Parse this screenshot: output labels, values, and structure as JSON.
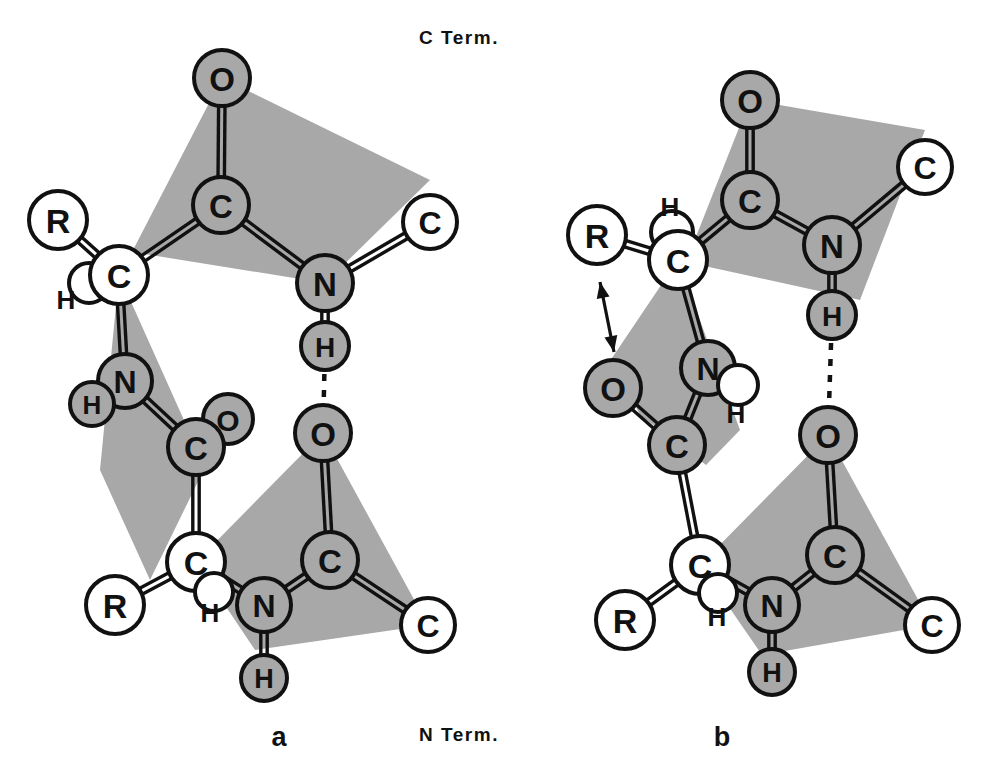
{
  "figure": {
    "title_top": "C Term.",
    "title_bottom": "N Term.",
    "panel_a_label": "a",
    "panel_b_label": "b",
    "colors": {
      "background": "#ffffff",
      "plane_fill": "#a8a8a8",
      "atom_filled": "#a8a8a8",
      "atom_open": "#ffffff",
      "stroke": "#111111"
    }
  },
  "chart_data": {
    "type": "diagram",
    "panels": [
      {
        "id": "a",
        "label": "a",
        "planes": [
          {
            "name": "amide-plane-a-top",
            "points": "222,78 430,180 325,283 132,252"
          },
          {
            "name": "amide-plane-a-middle",
            "points": "119,275 196,447 228,420 150,580 100,470"
          },
          {
            "name": "amide-plane-a-bottom",
            "points": "323,433 428,625 255,650 196,562"
          }
        ],
        "atoms": [
          {
            "id": "a-O1",
            "label": "O",
            "x": 222,
            "y": 78,
            "r": 28,
            "fill": "filled"
          },
          {
            "id": "a-C1",
            "label": "C",
            "x": 221,
            "y": 205,
            "r": 28,
            "fill": "filled"
          },
          {
            "id": "a-N1",
            "label": "N",
            "x": 325,
            "y": 283,
            "r": 28,
            "fill": "filled"
          },
          {
            "id": "a-Cterm1",
            "label": "C",
            "x": 430,
            "y": 222,
            "r": 27,
            "fill": "open"
          },
          {
            "id": "a-H1",
            "label": "H",
            "x": 325,
            "y": 346,
            "r": 24,
            "fill": "filled"
          },
          {
            "id": "a-R1",
            "label": "R",
            "x": 58,
            "y": 220,
            "r": 29,
            "fill": "open"
          },
          {
            "id": "a-Hsmall1",
            "label": "",
            "x": 89,
            "y": 283,
            "r": 20,
            "fill": "open"
          },
          {
            "id": "a-CA1",
            "label": "C",
            "x": 119,
            "y": 275,
            "r": 29,
            "fill": "open"
          },
          {
            "id": "a-N2",
            "label": "N",
            "x": 125,
            "y": 381,
            "r": 27,
            "fill": "filled"
          },
          {
            "id": "a-H2",
            "label": "H",
            "x": 92,
            "y": 404,
            "r": 22,
            "fill": "filled"
          },
          {
            "id": "a-Osm",
            "label": "O",
            "x": 228,
            "y": 419,
            "r": 25,
            "fill": "filled"
          },
          {
            "id": "a-C2",
            "label": "C",
            "x": 196,
            "y": 447,
            "r": 28,
            "fill": "filled"
          },
          {
            "id": "a-CA2",
            "label": "C",
            "x": 196,
            "y": 562,
            "r": 29,
            "fill": "open"
          },
          {
            "id": "a-Hsmall2",
            "label": "",
            "x": 214,
            "y": 592,
            "r": 19,
            "fill": "open"
          },
          {
            "id": "a-R2",
            "label": "R",
            "x": 115,
            "y": 605,
            "r": 29,
            "fill": "open"
          },
          {
            "id": "a-O2",
            "label": "O",
            "x": 323,
            "y": 433,
            "r": 28,
            "fill": "filled"
          },
          {
            "id": "a-C3",
            "label": "C",
            "x": 330,
            "y": 560,
            "r": 28,
            "fill": "filled"
          },
          {
            "id": "a-N3",
            "label": "N",
            "x": 264,
            "y": 605,
            "r": 27,
            "fill": "filled"
          },
          {
            "id": "a-H3",
            "label": "H",
            "x": 264,
            "y": 678,
            "r": 23,
            "fill": "filled"
          },
          {
            "id": "a-Cterm2",
            "label": "C",
            "x": 428,
            "y": 625,
            "r": 27,
            "fill": "open"
          }
        ],
        "text_labels": [
          {
            "text": "H",
            "x": 66,
            "y": 300
          },
          {
            "text": "H",
            "x": 210,
            "y": 613
          }
        ],
        "bonds": [
          {
            "from": "a-O1",
            "to": "a-C1",
            "order": "double"
          },
          {
            "from": "a-C1",
            "to": "a-N1",
            "order": "double"
          },
          {
            "from": "a-N1",
            "to": "a-Cterm1",
            "order": "double"
          },
          {
            "from": "a-N1",
            "to": "a-H1",
            "order": "double"
          },
          {
            "from": "a-C1",
            "to": "a-CA1",
            "order": "double"
          },
          {
            "from": "a-CA1",
            "to": "a-R1",
            "order": "double"
          },
          {
            "from": "a-CA1",
            "to": "a-N2",
            "order": "double"
          },
          {
            "from": "a-N2",
            "to": "a-C2",
            "order": "double"
          },
          {
            "from": "a-C2",
            "to": "a-CA2",
            "order": "double"
          },
          {
            "from": "a-CA2",
            "to": "a-R2",
            "order": "double"
          },
          {
            "from": "a-CA2",
            "to": "a-N3",
            "order": "double"
          },
          {
            "from": "a-N3",
            "to": "a-C3",
            "order": "double"
          },
          {
            "from": "a-C3",
            "to": "a-O2",
            "order": "double"
          },
          {
            "from": "a-C3",
            "to": "a-Cterm2",
            "order": "double"
          },
          {
            "from": "a-N3",
            "to": "a-H3",
            "order": "double"
          },
          {
            "from": "a-N2",
            "to": "a-H2",
            "order": "single"
          }
        ],
        "hydrogen_bonds": [
          {
            "from": "a-H1",
            "to": "a-O2",
            "style": "dashed"
          }
        ],
        "arrows": []
      },
      {
        "id": "b",
        "label": "b",
        "planes": [
          {
            "name": "amide-plane-b-top",
            "points": "750,100 925,130 860,300 686,262"
          },
          {
            "name": "amide-plane-b-middle",
            "points": "678,260 740,430 706,465 640,415 612,358"
          },
          {
            "name": "amide-plane-b-bottom",
            "points": "828,435 932,625 762,655 700,565"
          }
        ],
        "atoms": [
          {
            "id": "b-O1",
            "label": "O",
            "x": 750,
            "y": 100,
            "r": 28,
            "fill": "filled"
          },
          {
            "id": "b-C1",
            "label": "C",
            "x": 750,
            "y": 200,
            "r": 28,
            "fill": "filled"
          },
          {
            "id": "b-N1",
            "label": "N",
            "x": 832,
            "y": 245,
            "r": 28,
            "fill": "filled"
          },
          {
            "id": "b-Cterm1",
            "label": "C",
            "x": 925,
            "y": 167,
            "r": 27,
            "fill": "open"
          },
          {
            "id": "b-H1",
            "label": "H",
            "x": 832,
            "y": 315,
            "r": 24,
            "fill": "filled"
          },
          {
            "id": "b-R1",
            "label": "R",
            "x": 597,
            "y": 235,
            "r": 29,
            "fill": "open"
          },
          {
            "id": "b-Hsmall1",
            "label": "",
            "x": 672,
            "y": 232,
            "r": 21,
            "fill": "open"
          },
          {
            "id": "b-CA1",
            "label": "C",
            "x": 678,
            "y": 260,
            "r": 29,
            "fill": "open"
          },
          {
            "id": "b-N2",
            "label": "N",
            "x": 708,
            "y": 368,
            "r": 27,
            "fill": "filled"
          },
          {
            "id": "b-Hsmall2",
            "label": "",
            "x": 738,
            "y": 385,
            "r": 20,
            "fill": "open"
          },
          {
            "id": "b-O2s",
            "label": "O",
            "x": 613,
            "y": 388,
            "r": 28,
            "fill": "filled"
          },
          {
            "id": "b-C2",
            "label": "C",
            "x": 677,
            "y": 445,
            "r": 28,
            "fill": "filled"
          },
          {
            "id": "b-CA2",
            "label": "C",
            "x": 700,
            "y": 565,
            "r": 29,
            "fill": "open"
          },
          {
            "id": "b-Hsmall3",
            "label": "",
            "x": 718,
            "y": 593,
            "r": 19,
            "fill": "open"
          },
          {
            "id": "b-R2",
            "label": "R",
            "x": 625,
            "y": 620,
            "r": 29,
            "fill": "open"
          },
          {
            "id": "b-O3",
            "label": "O",
            "x": 828,
            "y": 435,
            "r": 28,
            "fill": "filled"
          },
          {
            "id": "b-C3",
            "label": "C",
            "x": 835,
            "y": 555,
            "r": 28,
            "fill": "filled"
          },
          {
            "id": "b-N3",
            "label": "N",
            "x": 772,
            "y": 605,
            "r": 27,
            "fill": "filled"
          },
          {
            "id": "b-H3",
            "label": "H",
            "x": 772,
            "y": 672,
            "r": 23,
            "fill": "filled"
          },
          {
            "id": "b-Cterm2",
            "label": "C",
            "x": 932,
            "y": 625,
            "r": 27,
            "fill": "open"
          }
        ],
        "text_labels": [
          {
            "text": "H",
            "x": 670,
            "y": 207
          },
          {
            "text": "H",
            "x": 736,
            "y": 414
          },
          {
            "text": "H",
            "x": 717,
            "y": 617
          }
        ],
        "bonds": [
          {
            "from": "b-O1",
            "to": "b-C1",
            "order": "double"
          },
          {
            "from": "b-C1",
            "to": "b-N1",
            "order": "double"
          },
          {
            "from": "b-N1",
            "to": "b-Cterm1",
            "order": "double"
          },
          {
            "from": "b-N1",
            "to": "b-H1",
            "order": "double"
          },
          {
            "from": "b-C1",
            "to": "b-CA1",
            "order": "double"
          },
          {
            "from": "b-CA1",
            "to": "b-R1",
            "order": "double"
          },
          {
            "from": "b-CA1",
            "to": "b-N2",
            "order": "double"
          },
          {
            "from": "b-N2",
            "to": "b-C2",
            "order": "double"
          },
          {
            "from": "b-C2",
            "to": "b-O2s",
            "order": "double"
          },
          {
            "from": "b-C2",
            "to": "b-CA2",
            "order": "double"
          },
          {
            "from": "b-CA2",
            "to": "b-R2",
            "order": "double"
          },
          {
            "from": "b-CA2",
            "to": "b-N3",
            "order": "double"
          },
          {
            "from": "b-N3",
            "to": "b-C3",
            "order": "double"
          },
          {
            "from": "b-C3",
            "to": "b-O3",
            "order": "double"
          },
          {
            "from": "b-C3",
            "to": "b-Cterm2",
            "order": "double"
          },
          {
            "from": "b-N3",
            "to": "b-H3",
            "order": "double"
          }
        ],
        "hydrogen_bonds": [
          {
            "from": "b-H1",
            "to": "b-O3",
            "style": "dashed"
          }
        ],
        "arrows": [
          {
            "name": "motion-arrow",
            "x1": 600,
            "y1": 282,
            "x2": 614,
            "y2": 352,
            "heads": "both"
          }
        ]
      }
    ]
  }
}
